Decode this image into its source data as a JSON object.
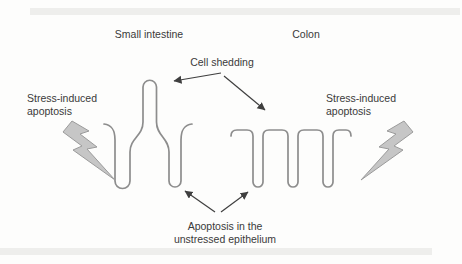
{
  "diagram": {
    "section_labels": {
      "small_intestine": "Small intestine",
      "colon": "Colon"
    },
    "annotations": {
      "cell_shedding": "Cell shedding",
      "stress_induced_left": {
        "line1": "Stress-induced",
        "line2": "apoptosis"
      },
      "stress_induced_right": {
        "line1": "Stress-induced",
        "line2": "apoptosis"
      },
      "unstressed_apoptosis": {
        "line1": "Apoptosis in the",
        "line2": "unstressed epithelium"
      }
    },
    "icons": {
      "left": "lightning-bolt-icon",
      "right": "lightning-bolt-icon"
    },
    "colors": {
      "background": "#fdfdfc",
      "scan_band": "#ebebe9",
      "epithelium_line": "#8d8d8d",
      "arrow": "#3f3f3f",
      "bolt_fill": "#c6c6c6",
      "bolt_stroke": "#9b9b9b",
      "text": "#3a3a3a"
    }
  }
}
